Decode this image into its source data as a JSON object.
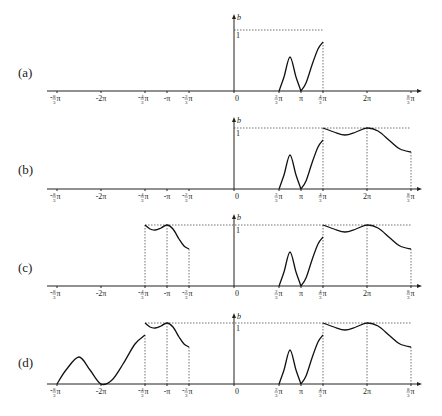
{
  "figure": {
    "panels": [
      {
        "id": "a",
        "label": "(a)",
        "axis_y": 91,
        "top_y": 14,
        "one_y": 30,
        "label_y": 77,
        "dotted_h": [
          [
            234,
            323
          ]
        ],
        "dotted_v": [
          323
        ],
        "curves": [
          "bump",
          "rise"
        ]
      },
      {
        "id": "b",
        "label": "(b)",
        "axis_y": 189,
        "top_y": 117,
        "one_y": 128,
        "label_y": 174,
        "dotted_h": [
          [
            234,
            323
          ]
        ],
        "dotted_v": [
          323,
          367,
          411
        ],
        "curves": [
          "bump",
          "rise",
          "plateau_right"
        ]
      },
      {
        "id": "c",
        "label": "(c)",
        "axis_y": 286,
        "top_y": 214,
        "one_y": 225,
        "label_y": 272,
        "dotted_h": [
          [
            145,
            323
          ]
        ],
        "dotted_v": [
          145,
          167,
          189,
          323,
          367,
          411
        ],
        "curves": [
          "bump",
          "rise",
          "plateau_right",
          "plateau_left"
        ]
      },
      {
        "id": "d",
        "label": "(d)",
        "axis_y": 384,
        "top_y": 313,
        "one_y": 323,
        "label_y": 367,
        "dotted_h": [
          [
            145,
            323
          ]
        ],
        "dotted_v": [
          145,
          167,
          189,
          323,
          367,
          411
        ],
        "curves": [
          "bump",
          "rise",
          "plateau_right",
          "plateau_left",
          "far_left"
        ]
      }
    ],
    "axis": {
      "x_start": 47,
      "x_end": 422,
      "origin_x": 234,
      "y_axis_name": "b",
      "unit_label": "1",
      "unit_px": 61
    },
    "ticks": [
      {
        "x": 57,
        "label": "-8/3π",
        "frac": true,
        "sign": "-",
        "num": "8",
        "den": "3"
      },
      {
        "x": 101,
        "label": "-2π",
        "frac": false
      },
      {
        "x": 145,
        "label": "-4/3π",
        "frac": true,
        "sign": "-",
        "num": "4",
        "den": "3"
      },
      {
        "x": 167,
        "label": "-π",
        "frac": false
      },
      {
        "x": 189,
        "label": "-2/3π",
        "frac": true,
        "sign": "-",
        "num": "2",
        "den": "3"
      },
      {
        "x": 234,
        "label": "0",
        "frac": false
      },
      {
        "x": 279,
        "label": "2/3π",
        "frac": true,
        "sign": "",
        "num": "2",
        "den": "3"
      },
      {
        "x": 301,
        "label": "π",
        "frac": false
      },
      {
        "x": 323,
        "label": "4/3π",
        "frac": true,
        "sign": "",
        "num": "4",
        "den": "3"
      },
      {
        "x": 367,
        "label": "2π",
        "frac": false
      },
      {
        "x": 411,
        "label": "8/3π",
        "frac": true,
        "sign": "",
        "num": "8",
        "den": "3"
      }
    ],
    "curve_shapes": {
      "bump": [
        [
          279,
          0
        ],
        [
          284,
          14
        ],
        [
          290,
          34
        ],
        [
          296,
          14
        ],
        [
          301,
          0
        ]
      ],
      "rise": [
        [
          301,
          0
        ],
        [
          306,
          8
        ],
        [
          312,
          26
        ],
        [
          318,
          42
        ],
        [
          323,
          49
        ]
      ],
      "plateau_right": [
        [
          323,
          61
        ],
        [
          334,
          57
        ],
        [
          345,
          54
        ],
        [
          356,
          57
        ],
        [
          367,
          61
        ],
        [
          378,
          58
        ],
        [
          390,
          48
        ],
        [
          400,
          40
        ],
        [
          411,
          37
        ]
      ],
      "plateau_left": [
        [
          145,
          61
        ],
        [
          150,
          57
        ],
        [
          155,
          56
        ],
        [
          161,
          58
        ],
        [
          167,
          61
        ],
        [
          173,
          57
        ],
        [
          179,
          47
        ],
        [
          184,
          40
        ],
        [
          189,
          37
        ]
      ],
      "far_left": [
        [
          57,
          0
        ],
        [
          66,
          14
        ],
        [
          79,
          27
        ],
        [
          90,
          14
        ],
        [
          101,
          0
        ],
        [
          112,
          4
        ],
        [
          123,
          20
        ],
        [
          135,
          40
        ],
        [
          145,
          49
        ]
      ]
    }
  }
}
